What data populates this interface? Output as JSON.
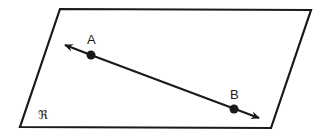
{
  "diagram": {
    "type": "geometry-plane-line",
    "plane": {
      "label": "ℜ",
      "corners": [
        [
          60,
          9
        ],
        [
          311,
          10
        ],
        [
          271,
          128
        ],
        [
          20,
          127
        ]
      ],
      "stroke": "#1a1a1a"
    },
    "line": {
      "start_arrow": [
        64,
        45
      ],
      "end_arrow": [
        259,
        118
      ],
      "stroke": "#1a1a1a"
    },
    "points": [
      {
        "name": "A",
        "label": "A",
        "x": 91,
        "y": 55
      },
      {
        "name": "B",
        "label": "B",
        "x": 234,
        "y": 109
      }
    ]
  }
}
